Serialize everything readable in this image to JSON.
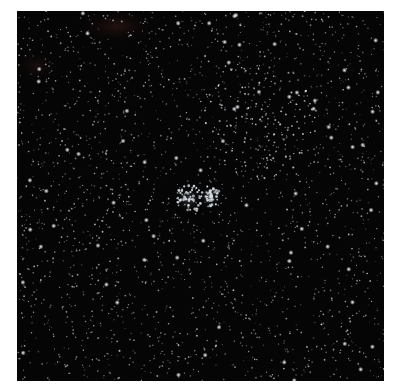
{
  "image": {
    "subject": "Star field with double star cluster",
    "background_color": "#050505",
    "page_background": "#ffffff",
    "frame": {
      "x": 17,
      "y": 11,
      "width": 367,
      "height": 370
    }
  },
  "features": {
    "cluster_centers": [
      {
        "x": 172,
        "y": 188,
        "radius": 14,
        "density": 55
      },
      {
        "x": 193,
        "y": 186,
        "radius": 12,
        "density": 50
      }
    ],
    "diffuse_cluster": {
      "x": 240,
      "y": 110,
      "radius": 60,
      "density": 120
    },
    "nebula_patches": [
      {
        "x": 100,
        "y": 15,
        "rx": 45,
        "ry": 20,
        "color": "#5a2a22",
        "opacity": 0.35
      },
      {
        "x": 20,
        "y": 55,
        "rx": 25,
        "ry": 18,
        "color": "#4a2420",
        "opacity": 0.3
      }
    ],
    "field_star_count": 2200,
    "bright_star_count": 70,
    "star_color": "#e6ecf2"
  }
}
